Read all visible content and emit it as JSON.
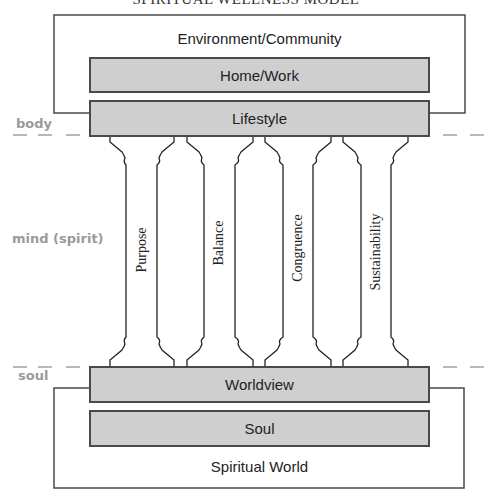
{
  "title": "SPIRITUAL WELLNESS MODEL",
  "outer_top_label": "Environment/Community",
  "layers_top": [
    {
      "label": "Home/Work"
    },
    {
      "label": "Lifestyle"
    }
  ],
  "pillars": [
    {
      "label": "Purpose"
    },
    {
      "label": "Balance"
    },
    {
      "label": "Congruence"
    },
    {
      "label": "Sustainability"
    }
  ],
  "layers_bottom": [
    {
      "label": "Worldview"
    },
    {
      "label": "Soul"
    }
  ],
  "outer_bottom_label": "Spiritual World",
  "side_labels": {
    "body": "body",
    "mind": "mind (spirit)",
    "soul": "soul"
  },
  "colors": {
    "box_fill": "#cfcfcf",
    "line": "#4a4a4a",
    "side_label": "#9a9a9a"
  }
}
